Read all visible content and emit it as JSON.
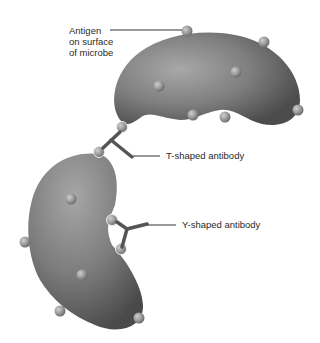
{
  "diagram": {
    "labels": {
      "antigen": [
        "Antigen",
        "on surface",
        "of microbe"
      ],
      "t_antibody": "T-shaped antibody",
      "y_antibody": "Y-shaped antibody"
    },
    "colors": {
      "background": "#ffffff",
      "microbe_light": "#a6a6a6",
      "microbe_mid": "#7d7d7d",
      "microbe_dark": "#4e4e4e",
      "antigen_light": "#c8c8c8",
      "antigen_dark": "#858585",
      "antibody": "#555555",
      "leader_line": "#333333",
      "text": "#2a2a2a"
    },
    "elements": [
      {
        "id": "microbe-top",
        "type": "bean-shaped microbe",
        "position": "upper right"
      },
      {
        "id": "microbe-bottom",
        "type": "bean-shaped microbe",
        "position": "lower left"
      },
      {
        "id": "t-antibody",
        "type": "T-shaped antibody",
        "connects": [
          "microbe-top",
          "microbe-bottom"
        ]
      },
      {
        "id": "y-antibody",
        "type": "Y-shaped antibody",
        "connects": [
          "microbe-bottom",
          "microbe-bottom"
        ]
      }
    ]
  }
}
